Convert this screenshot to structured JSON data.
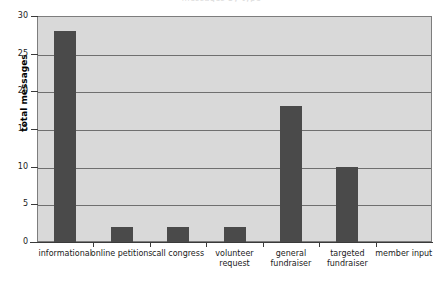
{
  "chart_data": {
    "type": "bar",
    "title": "messages by type",
    "xlabel": "",
    "ylabel": "total messages",
    "categories": [
      "informational",
      "online petitions",
      "call congress",
      "volunteer\nrequest",
      "general\nfundraiser",
      "targeted\nfundraiser",
      "member input"
    ],
    "values": [
      28,
      2,
      2,
      2,
      18,
      10,
      0
    ],
    "ylim": [
      0,
      30
    ],
    "yticks": [
      0,
      5,
      10,
      15,
      20,
      25,
      30
    ],
    "ytick_labels": [
      "0",
      "5",
      "10",
      "15",
      "20",
      "25",
      "30"
    ],
    "grid": true,
    "legend": false,
    "colors": {
      "bar": "#4a4a4a",
      "plot_background": "#d9d9d9",
      "page_background": "#ffffff",
      "gridline": "#6f6f6f",
      "axis": "#3a3a3a",
      "text": "#1a1a1a"
    }
  }
}
